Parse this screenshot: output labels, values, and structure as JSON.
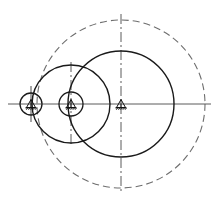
{
  "drawing": {
    "title": "Engineering Drawing — Nested Circles with Datum Symbols",
    "caption": "",
    "background_color": "#ffffff",
    "canvas": {
      "width": 219,
      "height": 199
    },
    "colors": {
      "solid_stroke": "#1a1a1a",
      "dashed_stroke": "#6e6e6e",
      "axis_stroke": "#5a5a5a",
      "datum_stroke": "#111111"
    },
    "axis": {
      "name": "horizontal-centerline",
      "y": 104,
      "x_start": 8,
      "x_end": 211,
      "style": "solid-thin"
    },
    "centers": [
      {
        "id": "center-left",
        "label": "",
        "x": 31,
        "y": 104,
        "datum_symbol": "support-triangle-icon",
        "circle_radius": 11,
        "tick_top": 26,
        "tick_bottom": 18
      },
      {
        "id": "center-middle",
        "label": "",
        "x": 71,
        "y": 104,
        "datum_symbol": "support-triangle-icon",
        "circle_radius": 12,
        "tick_top": 42,
        "tick_bottom": 42
      },
      {
        "id": "center-right",
        "label": "",
        "x": 121,
        "y": 104,
        "datum_symbol": "support-triangle-icon",
        "circle_radius": 0,
        "tick_top": 86,
        "tick_bottom": 86
      }
    ],
    "circles": [
      {
        "id": "small-circle-left",
        "style": "solid",
        "cx": 31,
        "cy": 104,
        "r": 11,
        "stroke": "#1a1a1a"
      },
      {
        "id": "small-circle-middle",
        "style": "solid",
        "cx": 71,
        "cy": 104,
        "r": 12,
        "stroke": "#1a1a1a"
      },
      {
        "id": "medium-circle",
        "style": "solid",
        "cx": 71,
        "cy": 104,
        "r": 39,
        "stroke": "#1a1a1a"
      },
      {
        "id": "large-circle",
        "style": "solid",
        "cx": 121,
        "cy": 104,
        "r": 53,
        "stroke": "#1a1a1a"
      },
      {
        "id": "outer-dashed-circle",
        "style": "dashed",
        "cx": 121,
        "cy": 104,
        "r": 84,
        "stroke": "#6e6e6e"
      }
    ],
    "vertical_centerlines": [
      {
        "id": "vline-outer",
        "x": 121,
        "y_start": 14,
        "y_end": 194,
        "style": "dash-dot"
      },
      {
        "id": "vline-medium",
        "x": 71,
        "y_start": 62,
        "y_end": 146,
        "style": "dash-dot"
      },
      {
        "id": "vline-small-left",
        "x": 31,
        "y_start": 86,
        "y_end": 122,
        "style": "solid-thin"
      }
    ]
  }
}
